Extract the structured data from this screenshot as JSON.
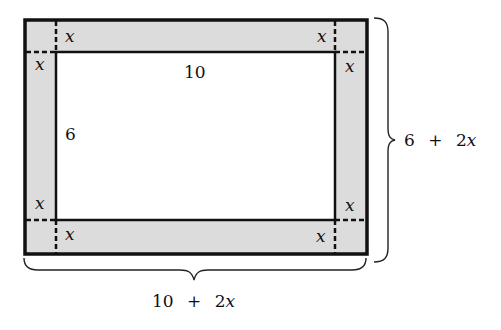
{
  "diagram": {
    "type": "rectangle-with-border-strip",
    "inner_rect": {
      "width_label": "10",
      "height_label": "6"
    },
    "border": {
      "width_label": "x",
      "fill_color": "#dcdcdc"
    },
    "outer_dimensions": {
      "width_label": "10 + 2x",
      "height_label": "6 + 2x"
    },
    "corner_labels": {
      "top_left_horizontal": "x",
      "top_left_vertical": "x",
      "top_right_horizontal": "x",
      "top_right_vertical": "x",
      "bottom_left_vertical": "x",
      "bottom_left_horizontal": "x",
      "bottom_right_vertical": "x",
      "bottom_right_horizontal": "x"
    },
    "height_label_parts": {
      "a": "6",
      "op": "+",
      "b": "2",
      "var": "x"
    },
    "width_label_parts": {
      "a": "10",
      "op": "+",
      "b": "2",
      "var": "x"
    },
    "colors": {
      "line": "#111111",
      "band": "#dcdcdc",
      "background": "#ffffff"
    }
  }
}
